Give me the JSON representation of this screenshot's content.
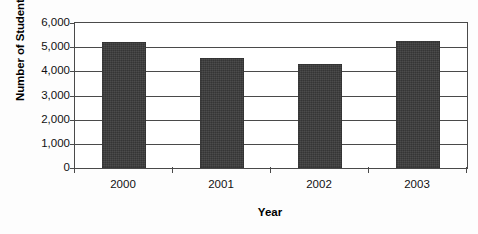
{
  "chart_data": {
    "type": "bar",
    "title": "",
    "subtitle": "",
    "xlabel": "Year",
    "ylabel": "Number of Students",
    "categories": [
      "2000",
      "2001",
      "2002",
      "2003"
    ],
    "values": [
      5200,
      4550,
      4300,
      5250
    ],
    "series": [
      {
        "name": "Number of Students",
        "values": [
          5200,
          4550,
          4300,
          5250
        ]
      }
    ],
    "ylim": [
      0,
      6000
    ],
    "ytick_values": [
      0,
      1000,
      2000,
      3000,
      4000,
      5000,
      6000
    ],
    "ytick_labels": [
      "0",
      "1,000",
      "2,000",
      "3,000",
      "4,000",
      "5,000",
      "6,000"
    ],
    "grid": true,
    "grid_axis": "y",
    "legend": false,
    "legend_position": "none",
    "bar_color": "#3a3a3a",
    "axis_color": "#4a4a4a",
    "background_color": "#ffffff",
    "annotations": []
  }
}
